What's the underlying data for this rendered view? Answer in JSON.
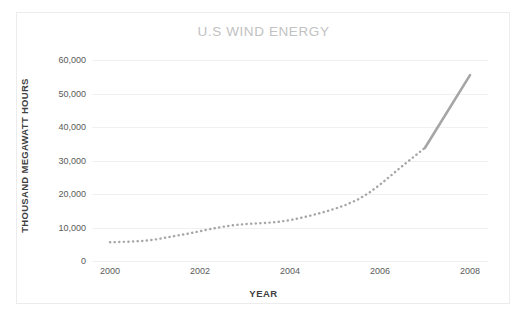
{
  "chart_data": {
    "type": "line",
    "title": "U.S WIND ENERGY",
    "xlabel": "YEAR",
    "ylabel": "THOUSAND MEGAWATT HOURS",
    "x": [
      2000,
      2000.25,
      2000.5,
      2000.75,
      2001,
      2001.25,
      2001.5,
      2001.75,
      2002,
      2002.25,
      2002.5,
      2002.75,
      2003,
      2003.25,
      2003.5,
      2003.75,
      2004,
      2004.25,
      2004.5,
      2004.75,
      2005,
      2005.25,
      2005.5,
      2005.75,
      2006,
      2006.25,
      2006.5,
      2006.75,
      2007,
      2008
    ],
    "values": [
      5600,
      5700,
      5800,
      6000,
      6400,
      7000,
      7600,
      8200,
      8900,
      9600,
      10200,
      10700,
      11000,
      11200,
      11400,
      11700,
      12200,
      12900,
      13700,
      14600,
      15600,
      16800,
      18300,
      20300,
      22800,
      25600,
      28400,
      31100,
      33800,
      55500
    ],
    "series": [
      {
        "name": "U.S Wind Energy Generation",
        "style_segments": [
          {
            "style": "dotted",
            "from_index": 0,
            "to_index": 28
          },
          {
            "style": "solid",
            "from_index": 28,
            "to_index": 29
          }
        ]
      }
    ],
    "annual_values": {
      "2000": 5600,
      "2001": 6400,
      "2002": 8900,
      "2003": 11000,
      "2004": 12200,
      "2005": 15600,
      "2006": 22800,
      "2007": 33800,
      "2008": 55500
    },
    "xlim": [
      1999.6,
      2008.4
    ],
    "ylim": [
      0,
      60000
    ],
    "ytick_labels": [
      "60,000",
      "50,000",
      "40,000",
      "30,000",
      "20,000",
      "10,000",
      "0"
    ],
    "ytick_values": [
      60000,
      50000,
      40000,
      30000,
      20000,
      10000,
      0
    ],
    "xtick_labels": [
      "2000",
      "2002",
      "2004",
      "2006",
      "2008"
    ],
    "xtick_values": [
      2000,
      2002,
      2004,
      2006,
      2008
    ],
    "grid": "horizontal-only",
    "legend": "none",
    "colors": {
      "title": "#c2c2c2",
      "line": "#a6a6a6",
      "gridline": "#f0f0f0",
      "axis_text": "#5a5a5a",
      "axis_title": "#3f3f3f",
      "background": "#ffffff",
      "border": "#ececec"
    }
  }
}
